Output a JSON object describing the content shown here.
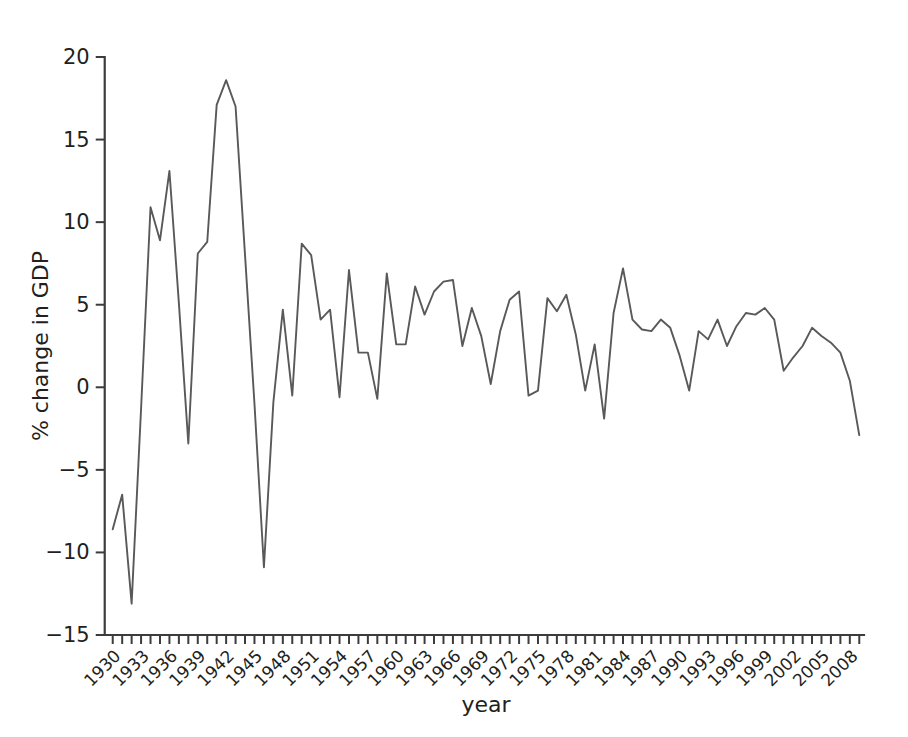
{
  "figure": {
    "background_color": "#ffffff",
    "line_color": "#595959",
    "axis_color": "#3c3c3c",
    "text_color": "#231f20"
  },
  "chart_data": {
    "type": "line",
    "title": "",
    "subtitle": "",
    "xlabel": "year",
    "ylabel": "% change in GDP",
    "xlim": [
      1929.5,
      2009.5
    ],
    "ylim": [
      -15,
      20
    ],
    "grid": false,
    "legend": null,
    "ytick_labels": [
      "20",
      "15",
      "10",
      "5",
      "0",
      "−5",
      "−10",
      "−15"
    ],
    "ytick_values": [
      20,
      15,
      10,
      5,
      0,
      -5,
      -10,
      -15
    ],
    "xtick_labels": [
      "1930",
      "1933",
      "1936",
      "1939",
      "1942",
      "1945",
      "1948",
      "1951",
      "1954",
      "1957",
      "1960",
      "1963",
      "1966",
      "1969",
      "1972",
      "1975",
      "1978",
      "1981",
      "1984",
      "1987",
      "1990",
      "1993",
      "1996",
      "1999",
      "2002",
      "2005",
      "2008"
    ],
    "xtick_values": [
      1930,
      1933,
      1936,
      1939,
      1942,
      1945,
      1948,
      1951,
      1954,
      1957,
      1960,
      1963,
      1966,
      1969,
      1972,
      1975,
      1978,
      1981,
      1984,
      1987,
      1990,
      1993,
      1996,
      1999,
      2002,
      2005,
      2008
    ],
    "x": [
      1930,
      1931,
      1932,
      1933,
      1934,
      1935,
      1936,
      1937,
      1938,
      1939,
      1940,
      1941,
      1942,
      1943,
      1944,
      1945,
      1946,
      1947,
      1948,
      1949,
      1950,
      1951,
      1952,
      1953,
      1954,
      1955,
      1956,
      1957,
      1958,
      1959,
      1960,
      1961,
      1962,
      1963,
      1964,
      1965,
      1966,
      1967,
      1968,
      1969,
      1970,
      1971,
      1972,
      1973,
      1974,
      1975,
      1976,
      1977,
      1978,
      1979,
      1980,
      1981,
      1982,
      1983,
      1984,
      1985,
      1986,
      1987,
      1988,
      1989,
      1990,
      1991,
      1992,
      1993,
      1994,
      1995,
      1996,
      1997,
      1998,
      1999,
      2000,
      2001,
      2002,
      2003,
      2004,
      2005,
      2006,
      2007,
      2008,
      2009
    ],
    "values": [
      -8.6,
      -6.5,
      -13.1,
      -1.3,
      10.9,
      8.9,
      13.1,
      5.1,
      -3.4,
      8.1,
      8.8,
      17.1,
      18.6,
      17.0,
      8.0,
      -1.0,
      -10.9,
      -0.9,
      4.7,
      -0.5,
      8.7,
      8.0,
      4.1,
      4.7,
      -0.6,
      7.1,
      2.1,
      2.1,
      -0.7,
      6.9,
      2.6,
      2.6,
      6.1,
      4.4,
      5.8,
      6.4,
      6.5,
      2.5,
      4.8,
      3.1,
      0.2,
      3.4,
      5.3,
      5.8,
      -0.5,
      -0.2,
      5.4,
      4.6,
      5.6,
      3.2,
      -0.2,
      2.6,
      -1.9,
      4.5,
      7.2,
      4.1,
      3.5,
      3.4,
      4.1,
      3.6,
      1.9,
      -0.2,
      3.4,
      2.9,
      4.1,
      2.5,
      3.7,
      4.5,
      4.4,
      4.8,
      4.1,
      1.0,
      1.8,
      2.5,
      3.6,
      3.1,
      2.7,
      2.1,
      0.4,
      -2.9
    ]
  }
}
